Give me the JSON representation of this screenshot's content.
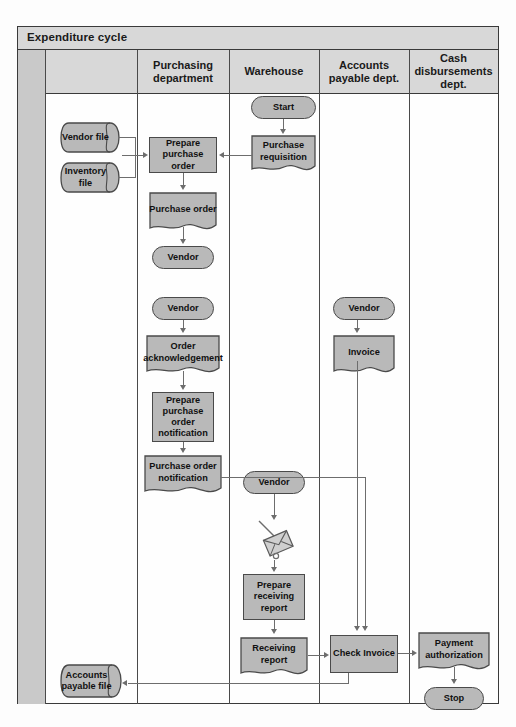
{
  "diagram": {
    "title": "Expenditure cycle",
    "type": "cross-functional-flowchart",
    "columns": [
      {
        "id": "col-blank",
        "label": ""
      },
      {
        "id": "col-unnamed",
        "label": ""
      },
      {
        "id": "col-purchasing",
        "label": "Purchasing department"
      },
      {
        "id": "col-warehouse",
        "label": "Warehouse"
      },
      {
        "id": "col-ap",
        "label": "Accounts payable dept."
      },
      {
        "id": "col-cash",
        "label": "Cash disbursements dept."
      }
    ],
    "nodes": [
      {
        "id": "start",
        "label": "Start",
        "shape": "terminator",
        "lane": "Warehouse"
      },
      {
        "id": "purchase-requisition",
        "label": "Purchase requisition",
        "shape": "document",
        "lane": "Warehouse"
      },
      {
        "id": "vendor-file",
        "label": "Vendor file",
        "shape": "cylinder",
        "lane": "unnamed"
      },
      {
        "id": "inventory-file",
        "label": "Inventory file",
        "shape": "cylinder",
        "lane": "unnamed"
      },
      {
        "id": "prepare-purchase-order",
        "label": "Prepare purchase order",
        "shape": "process",
        "lane": "Purchasing department"
      },
      {
        "id": "purchase-order",
        "label": "Purchase order",
        "shape": "document",
        "lane": "Purchasing department"
      },
      {
        "id": "vendor-1",
        "label": "Vendor",
        "shape": "terminator",
        "lane": "Purchasing department"
      },
      {
        "id": "vendor-2",
        "label": "Vendor",
        "shape": "terminator",
        "lane": "Purchasing department"
      },
      {
        "id": "order-acknowledgement",
        "label": "Order acknowledgement",
        "shape": "document",
        "lane": "Purchasing department"
      },
      {
        "id": "prepare-po-notification",
        "label": "Prepare purchase order notification",
        "shape": "process",
        "lane": "Purchasing department"
      },
      {
        "id": "purchase-order-notification",
        "label": "Purchase order notification",
        "shape": "document",
        "lane": "Purchasing department"
      },
      {
        "id": "vendor-3",
        "label": "Vendor",
        "shape": "terminator",
        "lane": "Accounts payable dept."
      },
      {
        "id": "invoice",
        "label": "Invoice",
        "shape": "document",
        "lane": "Accounts payable dept."
      },
      {
        "id": "vendor-4",
        "label": "Vendor",
        "shape": "terminator",
        "lane": "Warehouse"
      },
      {
        "id": "goods-delivery",
        "label": "",
        "shape": "envelope",
        "lane": "Warehouse"
      },
      {
        "id": "prepare-receiving-report",
        "label": "Prepare receiving report",
        "shape": "process",
        "lane": "Warehouse"
      },
      {
        "id": "receiving-report",
        "label": "Receiving report",
        "shape": "document",
        "lane": "Warehouse"
      },
      {
        "id": "check-invoice",
        "label": "Check Invoice",
        "shape": "process",
        "lane": "Accounts payable dept."
      },
      {
        "id": "accounts-payable-file",
        "label": "Accounts payable file",
        "shape": "cylinder",
        "lane": "unnamed"
      },
      {
        "id": "payment-authorization",
        "label": "Payment authorization",
        "shape": "document",
        "lane": "Cash disbursements dept."
      },
      {
        "id": "stop",
        "label": "Stop",
        "shape": "terminator",
        "lane": "Cash disbursements dept."
      }
    ],
    "node_labels": {
      "start": "Start",
      "purchase_requisition": "Purchase requisition",
      "vendor_file": "Vendor file",
      "inventory_file": "Inventory file",
      "prepare_purchase_order": "Prepare purchase order",
      "purchase_order": "Purchase order",
      "vendor_1": "Vendor",
      "vendor_2": "Vendor",
      "order_acknowledgement": "Order acknowledgement",
      "prepare_po_notification": "Prepare purchase order notification",
      "purchase_order_notification": "Purchase order notification",
      "vendor_3": "Vendor",
      "invoice": "Invoice",
      "vendor_4": "Vendor",
      "prepare_receiving_report": "Prepare receiving report",
      "receiving_report": "Receiving report",
      "check_invoice": "Check Invoice",
      "accounts_payable_file": "Accounts payable file",
      "payment_authorization": "Payment authorization",
      "stop": "Stop"
    },
    "colors": {
      "shape_fill": "#b9b9b9",
      "shape_stroke": "#4a4a4a",
      "header_fill": "#d8d8d8",
      "band_fill": "#c9c9c9",
      "connector": "#6d6d6d",
      "frame": "#3a3a3a"
    }
  },
  "caption": ""
}
